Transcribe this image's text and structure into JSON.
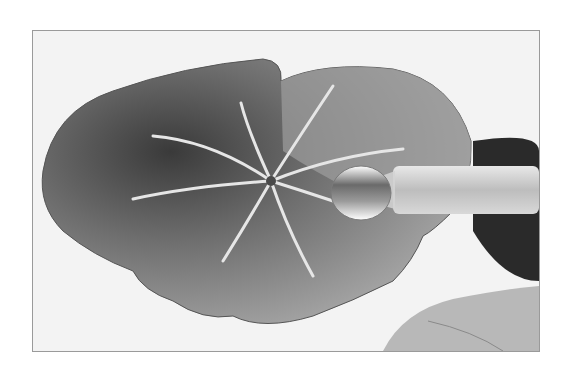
{
  "image": {
    "description": "Grayscale photograph of a watercolor-painted leaf with pale radiating veins; a clear glass rod rests on the leaf at right over a dark shadowed object",
    "alt": "Watercolor leaf with glass rod",
    "palette": {
      "paper": "#f3f3f3",
      "leaf_dark": "#3a3a3a",
      "leaf_mid": "#8a8a8a",
      "leaf_light": "#b4b4b4",
      "vein": "#e6e6e6",
      "rod": "#c8c8c8",
      "shadow": "#2a2a2a",
      "frame_border": "#9a9a9a"
    }
  }
}
